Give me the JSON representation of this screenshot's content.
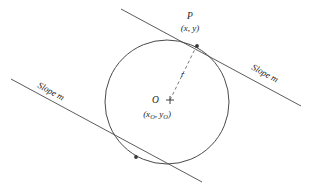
{
  "figure": {
    "background_color": "#ffffff",
    "line_color": "#4a4a4a",
    "text_color": "#1c1c1c",
    "labels": {
      "point_p": "P",
      "point_p_coords_open": "(",
      "point_p_coords": "(x, y)",
      "center_o": "O",
      "center_coords": "(x",
      "center_coords_sub1": "O",
      "center_coords_mid": ", y",
      "center_coords_sub2": "O",
      "center_coords_close": ")",
      "radius": "r",
      "slope_right": "Slope m",
      "slope_left": "Slope m"
    },
    "geometry": {
      "circle": {
        "cx": 167,
        "cy": 102,
        "r": 62
      },
      "tangent_upper": {
        "x1": 121,
        "y1": 9,
        "x2": 301,
        "y2": 106
      },
      "tangent_lower": {
        "x1": 11,
        "y1": 79,
        "x2": 202,
        "y2": 182
      },
      "radius_line": {
        "x1": 170,
        "y1": 100,
        "x2": 196,
        "y2": 47
      },
      "tangent_point_upper": {
        "x": 197,
        "y": 46
      },
      "tangent_point_lower": {
        "x": 136,
        "y": 157
      },
      "center_marker": {
        "x": 170,
        "y": 100
      },
      "slope_label_right_rotation": 28.5,
      "slope_label_left_rotation": 28.5
    }
  }
}
